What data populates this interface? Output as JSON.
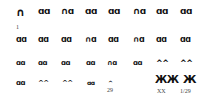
{
  "colors": {
    "chromosome": "#111111",
    "label": "#444444",
    "background": "#ffffff"
  },
  "rows": [
    {
      "y": 7,
      "items": [
        {
          "x": 16,
          "glyph": "∩",
          "size": 11
        },
        {
          "x": 38,
          "glyph": "ɑɑ",
          "size": 9
        },
        {
          "x": 61,
          "glyph": "∩ɑ",
          "size": 9
        },
        {
          "x": 85,
          "glyph": "ɑɑ",
          "size": 9
        },
        {
          "x": 108,
          "glyph": "ɑɑ",
          "size": 9
        },
        {
          "x": 133,
          "glyph": "∩ɑ",
          "size": 9
        },
        {
          "x": 156,
          "glyph": "ɑɑ",
          "size": 9
        },
        {
          "x": 180,
          "glyph": "ɑɑ",
          "size": 9
        }
      ]
    },
    {
      "y": 36,
      "items": [
        {
          "x": 16,
          "glyph": "ɑɑ",
          "size": 8
        },
        {
          "x": 38,
          "glyph": "ɑɑ",
          "size": 8
        },
        {
          "x": 61,
          "glyph": "ɑɑ",
          "size": 8
        },
        {
          "x": 85,
          "glyph": "∩ɑ",
          "size": 8
        },
        {
          "x": 108,
          "glyph": "ɑɑ",
          "size": 8
        },
        {
          "x": 133,
          "glyph": "∩ɑ",
          "size": 8
        },
        {
          "x": 156,
          "glyph": "ɑɑ",
          "size": 8
        },
        {
          "x": 180,
          "glyph": "ɑɑ",
          "size": 8
        }
      ]
    },
    {
      "y": 60,
      "items": [
        {
          "x": 16,
          "glyph": "ɑɑ",
          "size": 7
        },
        {
          "x": 38,
          "glyph": "ɑɑ",
          "size": 7
        },
        {
          "x": 61,
          "glyph": "ɑɑ",
          "size": 7
        },
        {
          "x": 86,
          "glyph": "ɑɑ",
          "size": 7
        },
        {
          "x": 107,
          "glyph": "∩ɑ",
          "size": 7
        },
        {
          "x": 133,
          "glyph": "ɑɑ",
          "size": 7
        },
        {
          "x": 156,
          "glyph": "^^",
          "size": 8
        },
        {
          "x": 180,
          "glyph": "^^",
          "size": 8
        }
      ]
    },
    {
      "y": 80,
      "items": [
        {
          "x": 16,
          "glyph": "ɑɑ",
          "size": 7
        },
        {
          "x": 38,
          "glyph": "^^",
          "size": 7
        },
        {
          "x": 62,
          "glyph": "^^",
          "size": 7
        },
        {
          "x": 87,
          "glyph": "ɑɑ",
          "size": 6
        },
        {
          "x": 108,
          "glyph": "^",
          "size": 6
        }
      ]
    }
  ],
  "sex_chromosomes": [
    {
      "x": 155,
      "y": 75,
      "glyph": "ЖЖ",
      "size": 10
    },
    {
      "x": 183,
      "y": 74,
      "glyph": "Ж",
      "size": 11
    }
  ],
  "labels": [
    {
      "x": 16,
      "y": 24,
      "text": "1"
    },
    {
      "x": 107,
      "y": 87,
      "text": "29"
    },
    {
      "x": 157,
      "y": 88,
      "text": "XX"
    },
    {
      "x": 180,
      "y": 88,
      "text": "1/29"
    }
  ]
}
